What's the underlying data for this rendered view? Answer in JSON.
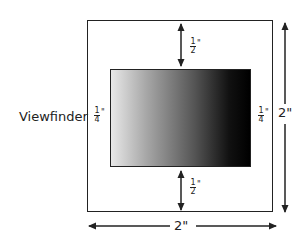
{
  "diagram": {
    "viewfinder_label": "Viewfinder",
    "margins": {
      "top": {
        "num": "1",
        "den": "2",
        "unit": "\""
      },
      "bottom": {
        "num": "1",
        "den": "2",
        "unit": "\""
      },
      "left": {
        "num": "1",
        "den": "4",
        "unit": "\""
      },
      "right": {
        "num": "1",
        "den": "4",
        "unit": "\""
      }
    },
    "outer_width_label": "2\"",
    "outer_height_label": "2\"",
    "colors": {
      "line": "#222222",
      "gradient_start": "#e8e8e8",
      "gradient_end": "#000000"
    }
  }
}
